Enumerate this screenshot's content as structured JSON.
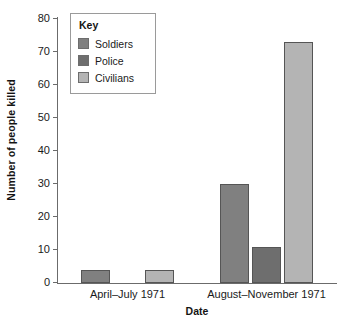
{
  "chart_data": {
    "type": "bar",
    "title": "",
    "subtitle": "",
    "xlabel": "Date",
    "ylabel": "Number of people killed",
    "categories": [
      "April–July 1971",
      "August–November 1971"
    ],
    "series": [
      {
        "name": "Soldiers",
        "values": [
          4,
          30
        ],
        "color": "#808080"
      },
      {
        "name": "Police",
        "values": [
          0,
          11
        ],
        "color": "#6e6e6e"
      },
      {
        "name": "Civilians",
        "values": [
          4,
          73
        ],
        "color": "#b4b4b4"
      }
    ],
    "ylim": [
      0,
      80
    ],
    "ytick_step": 10,
    "yticks": [
      0,
      10,
      20,
      30,
      40,
      50,
      60,
      70,
      80
    ],
    "grid": false,
    "legend_position": "top-left",
    "legend_title": "Key",
    "bar_edge_color": "#555555",
    "axis_color": "#6b6b6b",
    "background_color": "#ffffff"
  },
  "legend": {
    "title": "Key",
    "entries": [
      {
        "label": "Soldiers",
        "color": "#808080"
      },
      {
        "label": "Police",
        "color": "#6e6e6e"
      },
      {
        "label": "Civilians",
        "color": "#b4b4b4"
      }
    ]
  }
}
